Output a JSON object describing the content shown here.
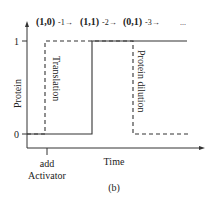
{
  "diagram": {
    "state_sequence": {
      "states": [
        "(1,0)",
        "(1,1)",
        "(0,1)"
      ],
      "transitions": [
        "-1→",
        "-2→",
        "-3→"
      ],
      "ellipsis": "..."
    },
    "y_axis": {
      "label": "Protein",
      "ticks": [
        "1",
        "0"
      ]
    },
    "x_axis": {
      "label": "Time",
      "tick_label_line1": "add",
      "tick_label_line2": "Activator"
    },
    "annotations": {
      "translation": "Translation",
      "dilution": "Protein dilution"
    },
    "caption": "(b)",
    "series": [
      {
        "name": "solid",
        "style": "solid",
        "points": "0→1 at later time, stays 1"
      },
      {
        "name": "dashed",
        "style": "dashed",
        "points": "0→1 after activator, back to 0 via dilution"
      }
    ]
  }
}
